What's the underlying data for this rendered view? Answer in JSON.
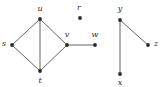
{
  "figure": {
    "name": "undirected-graph-diagram",
    "width": 163,
    "height": 87,
    "background_color": "#ffffff"
  },
  "style": {
    "vertex_color": "#2b2b2b",
    "vertex_radius": 1.9,
    "edge_color": "#555555",
    "edge_width": 0.9,
    "label_color": "#2b2b2b",
    "label_font_size": 8
  },
  "chart_data": {
    "type": "diagram",
    "subtype": "node-link-graph",
    "title": "",
    "directed": false,
    "components": 3,
    "nodes": [
      {
        "id": "u",
        "label": "u",
        "x": 40,
        "y": 19,
        "label_x": 40,
        "label_y": 9
      },
      {
        "id": "s",
        "label": "s",
        "x": 12,
        "y": 45,
        "label_x": 4,
        "label_y": 44
      },
      {
        "id": "t",
        "label": "t",
        "x": 40,
        "y": 71,
        "label_x": 40,
        "label_y": 81
      },
      {
        "id": "v",
        "label": "v",
        "x": 67,
        "y": 45,
        "label_x": 67,
        "label_y": 35
      },
      {
        "id": "w",
        "label": "w",
        "x": 95,
        "y": 45,
        "label_x": 95,
        "label_y": 35
      },
      {
        "id": "r",
        "label": "r",
        "x": 80,
        "y": 18,
        "label_x": 79,
        "label_y": 8
      },
      {
        "id": "y",
        "label": "y",
        "x": 120,
        "y": 20,
        "label_x": 120,
        "label_y": 9
      },
      {
        "id": "z",
        "label": "z",
        "x": 148,
        "y": 45,
        "label_x": 156,
        "label_y": 44
      },
      {
        "id": "x",
        "label": "x",
        "x": 120,
        "y": 74,
        "label_x": 120,
        "label_y": 83
      }
    ],
    "edges": [
      {
        "source": "s",
        "target": "u"
      },
      {
        "source": "u",
        "target": "v"
      },
      {
        "source": "s",
        "target": "t"
      },
      {
        "source": "t",
        "target": "v"
      },
      {
        "source": "u",
        "target": "t"
      },
      {
        "source": "v",
        "target": "w"
      },
      {
        "source": "y",
        "target": "z"
      },
      {
        "source": "y",
        "target": "x"
      }
    ],
    "isolated_nodes": [
      "r"
    ]
  }
}
